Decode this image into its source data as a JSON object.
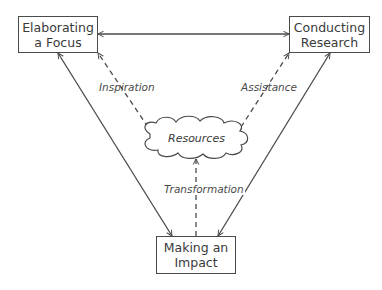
{
  "diagram": {
    "nodes": {
      "focus": {
        "line1": "Elaborating",
        "line2": "a Focus"
      },
      "research": {
        "line1": "Conducting",
        "line2": "Research"
      },
      "impact": {
        "line1": "Making an",
        "line2": "Impact"
      },
      "resources": {
        "label": "Resources"
      }
    },
    "edges": {
      "inspiration": "Inspiration",
      "assistance": "Assistance",
      "transformation": "Transformation"
    },
    "colors": {
      "stroke": "#4a4a4a",
      "text": "#3a3a3a",
      "background": "#ffffff"
    }
  }
}
